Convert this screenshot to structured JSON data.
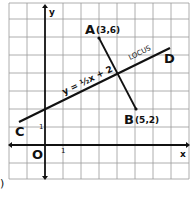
{
  "figure": {
    "label_marker": ")",
    "axes": {
      "x_label": "x",
      "y_label": "y",
      "origin_label": "O",
      "x_unit_label": "1",
      "y_unit_label": "1"
    },
    "line": {
      "equation_label": "y = ½x + 2",
      "locus_label": "LOCUS",
      "start_label": "C",
      "end_label": "D"
    },
    "points": [
      {
        "name": "A",
        "coords": "(3,6)",
        "x": 3,
        "y": 6
      },
      {
        "name": "B",
        "coords": "(5,2)",
        "x": 5,
        "y": 2
      }
    ],
    "grid": {
      "x_range": [
        -2,
        8
      ],
      "y_range": [
        -2,
        8
      ]
    },
    "colors": {
      "ink": "#111111",
      "grid": "#9a9a9a",
      "background": "#ffffff"
    }
  }
}
